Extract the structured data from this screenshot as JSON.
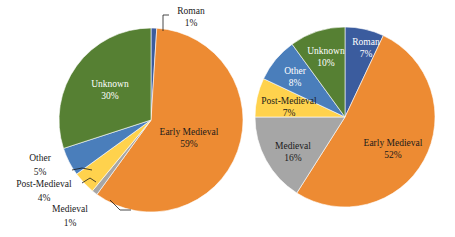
{
  "figure": {
    "background": "#ffffff",
    "label_dark": "#1a1a1a",
    "label_light": "#ffffff"
  },
  "palette": {
    "early_medieval": "#ED8B33",
    "medieval": "#A6A6A6",
    "post_medieval": "#FFD24D",
    "other": "#4A7EBB",
    "unknown": "#568033",
    "roman": "#3B5C9E"
  },
  "chart_data": [
    {
      "type": "pie",
      "id": "left-pie",
      "title": "",
      "start_angle_deg": 0,
      "direction": "clockwise",
      "center": {
        "cx": 151,
        "cy": 120
      },
      "radius": 92,
      "categories": [
        "Roman",
        "Early Medieval",
        "Medieval",
        "Post-Medieval",
        "Other",
        "Unknown"
      ],
      "values": [
        1,
        59,
        1,
        4,
        5,
        30
      ],
      "colors": [
        "#3B5C9E",
        "#ED8B33",
        "#A6A6A6",
        "#FFD24D",
        "#4A7EBB",
        "#568033"
      ],
      "slices": [
        {
          "name": "Roman",
          "pct_text": "1%",
          "value": 1,
          "color": "#3B5C9E",
          "label_style": "callout",
          "label_color": "#1a1a1a",
          "label_x": 191,
          "label_y": 12,
          "pct_x": 191,
          "pct_y": 24,
          "leader": "M 163,31 L 163,15 L 169,15"
        },
        {
          "name": "Early Medieval",
          "pct_text": "59%",
          "value": 59,
          "color": "#ED8B33",
          "label_style": "inside",
          "label_color": "#1a1a1a",
          "label_x": 189,
          "label_y": 133,
          "pct_x": 189,
          "pct_y": 145
        },
        {
          "name": "Medieval",
          "pct_text": "1%",
          "value": 1,
          "color": "#A6A6A6",
          "label_style": "callout",
          "label_color": "#1a1a1a",
          "label_x": 70,
          "label_y": 210,
          "pct_x": 70,
          "pct_y": 224,
          "leader": "M 131,210 L 120,210 L 110,200"
        },
        {
          "name": "Post-Medieval",
          "pct_text": "4%",
          "value": 4,
          "color": "#FFD24D",
          "label_style": "callout",
          "label_color": "#1a1a1a",
          "label_x": 44,
          "label_y": 185,
          "pct_x": 44,
          "pct_y": 199,
          "leader": "M 96,182 L 90,178 L 82,183"
        },
        {
          "name": "Other",
          "pct_text": "5%",
          "value": 5,
          "color": "#4A7EBB",
          "label_style": "callout",
          "label_color": "#1a1a1a",
          "label_x": 40,
          "label_y": 159,
          "pct_x": 40,
          "pct_y": 173,
          "leader": "M 92,170 L 82,168 L 72,170"
        },
        {
          "name": "Unknown",
          "pct_text": "30%",
          "value": 30,
          "color": "#568033",
          "label_style": "inside",
          "label_color": "#ffffff",
          "label_x": 110,
          "label_y": 85,
          "pct_x": 110,
          "pct_y": 97
        }
      ]
    },
    {
      "type": "pie",
      "id": "right-pie",
      "title": "",
      "start_angle_deg": 0,
      "direction": "clockwise",
      "center": {
        "cx": 345,
        "cy": 117
      },
      "radius": 90,
      "categories": [
        "Roman",
        "Early Medieval",
        "Medieval",
        "Post-Medieval",
        "Other",
        "Unknown"
      ],
      "values": [
        7,
        52,
        16,
        7,
        8,
        10
      ],
      "colors": [
        "#3B5C9E",
        "#ED8B33",
        "#A6A6A6",
        "#FFD24D",
        "#4A7EBB",
        "#568033"
      ],
      "slices": [
        {
          "name": "Roman",
          "pct_text": "7%",
          "value": 7,
          "color": "#3B5C9E",
          "label_style": "inside",
          "label_color": "#ffffff",
          "label_x": 366,
          "label_y": 43,
          "pct_x": 366,
          "pct_y": 55
        },
        {
          "name": "Early Medieval",
          "pct_text": "52%",
          "value": 52,
          "color": "#ED8B33",
          "label_style": "inside",
          "label_color": "#1a1a1a",
          "label_x": 393,
          "label_y": 144,
          "pct_x": 393,
          "pct_y": 156
        },
        {
          "name": "Medieval",
          "pct_text": "16%",
          "value": 16,
          "color": "#A6A6A6",
          "label_style": "inside",
          "label_color": "#1a1a1a",
          "label_x": 293,
          "label_y": 147,
          "pct_x": 293,
          "pct_y": 159
        },
        {
          "name": "Post-Medieval",
          "pct_text": "7%",
          "value": 7,
          "color": "#FFD24D",
          "label_style": "inside",
          "label_color": "#1a1a1a",
          "label_x": 289,
          "label_y": 102,
          "pct_x": 289,
          "pct_y": 114
        },
        {
          "name": "Other",
          "pct_text": "8%",
          "value": 8,
          "color": "#4A7EBB",
          "label_style": "inside",
          "label_color": "#ffffff",
          "label_x": 295,
          "label_y": 72,
          "pct_x": 295,
          "pct_y": 84
        },
        {
          "name": "Unknown",
          "pct_text": "10%",
          "value": 10,
          "color": "#568033",
          "label_style": "inside",
          "label_color": "#ffffff",
          "label_x": 326,
          "label_y": 52,
          "pct_x": 326,
          "pct_y": 64
        }
      ]
    }
  ]
}
